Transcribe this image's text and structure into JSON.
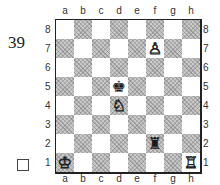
{
  "puzzle": {
    "number": "39",
    "solved_checkbox": false
  },
  "board": {
    "files": [
      "a",
      "b",
      "c",
      "d",
      "e",
      "f",
      "g",
      "h"
    ],
    "ranks": [
      "8",
      "7",
      "6",
      "5",
      "4",
      "3",
      "2",
      "1"
    ],
    "colors": {
      "light": "#ffffff",
      "dark": "#c9c9c9"
    },
    "pieces": [
      {
        "square": "f7",
        "color": "white",
        "type": "pawn",
        "glyph": "♙"
      },
      {
        "square": "d5",
        "color": "black",
        "type": "king",
        "glyph": "♚"
      },
      {
        "square": "d4",
        "color": "white",
        "type": "knight",
        "glyph": "♘"
      },
      {
        "square": "f2",
        "color": "black",
        "type": "rook",
        "glyph": "♜"
      },
      {
        "square": "a1",
        "color": "white",
        "type": "king",
        "glyph": "♔"
      },
      {
        "square": "h1",
        "color": "white",
        "type": "rook",
        "glyph": "♖"
      }
    ]
  }
}
